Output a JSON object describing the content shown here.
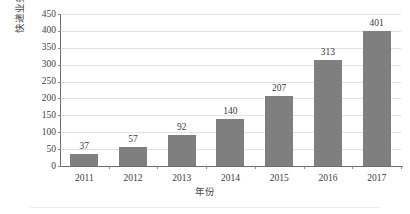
{
  "chart_data": {
    "type": "bar",
    "title": "",
    "xlabel": "年份",
    "ylabel": "快递业务量(亿件)",
    "categories": [
      "2011",
      "2012",
      "2013",
      "2014",
      "2015",
      "2016",
      "2017"
    ],
    "values": [
      37,
      57,
      92,
      140,
      207,
      313,
      401
    ],
    "value_labels": [
      "37",
      "57",
      "92",
      "140",
      "207",
      "313",
      "401"
    ],
    "ylim": [
      0,
      450
    ],
    "ytick_step": 50,
    "ytick_labels": [
      "0",
      "50",
      "100",
      "150",
      "200",
      "250",
      "300",
      "350",
      "400",
      "450"
    ],
    "ytick_values": [
      0,
      50,
      100,
      150,
      200,
      250,
      300,
      350,
      400,
      450
    ],
    "grid": "horizontal",
    "legend": "none",
    "series": [
      {
        "name": "快递业务量(亿件)",
        "color": "#7f7f7f",
        "values": [
          37,
          57,
          92,
          140,
          207,
          313,
          401
        ]
      }
    ],
    "colors": {
      "bar": "#7f7f7f",
      "gridline": "#e3e3e3",
      "axis": "#6e6e6e",
      "text": "#3a3a3a",
      "background": "#ffffff"
    }
  }
}
